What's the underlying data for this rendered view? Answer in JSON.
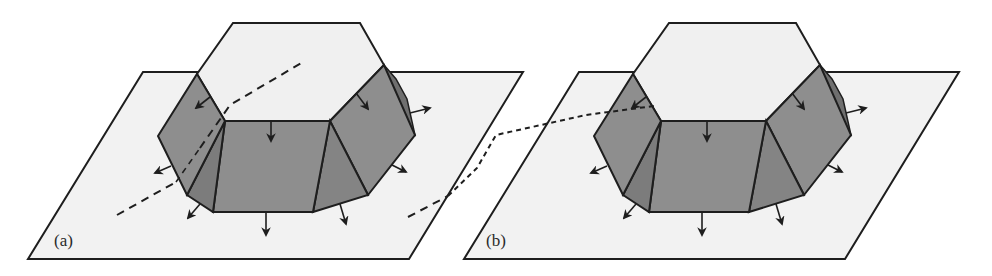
{
  "figure": {
    "panels": [
      {
        "id": "a",
        "label": "(a)",
        "dashed_line": "long-dash through left faces",
        "offset_x": 0
      },
      {
        "id": "b",
        "label": "(b)",
        "dashed_line": "short-dash through front-left corner",
        "offset_x": 436
      }
    ],
    "colors": {
      "plane_fill": "#f2f2f2",
      "top_face_fill": "#f0f0f0",
      "side_face_fill": "#8e8e8e",
      "side_face_dark": "#7c7c7c",
      "stroke": "#1e1e1e"
    },
    "arrow_count_per_panel": 10
  }
}
